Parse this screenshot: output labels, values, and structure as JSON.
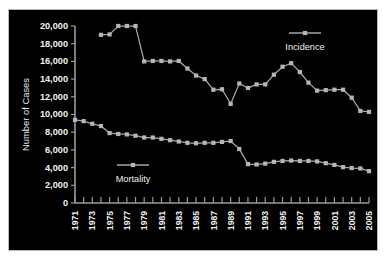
{
  "chart_data": {
    "type": "line",
    "title": "",
    "xlabel": "",
    "ylabel": "Number of Cases",
    "ylim": [
      0,
      20000
    ],
    "ytick_labels": [
      "0",
      "2,000",
      "4,000",
      "6,000",
      "8,000",
      "10,000",
      "12,000",
      "14,000",
      "16,000",
      "18,000",
      "20,000"
    ],
    "ytick_values": [
      0,
      2000,
      4000,
      6000,
      8000,
      10000,
      12000,
      14000,
      16000,
      18000,
      20000
    ],
    "xlim": [
      1971,
      2005
    ],
    "x": [
      1971,
      1972,
      1973,
      1974,
      1975,
      1976,
      1977,
      1978,
      1979,
      1980,
      1981,
      1982,
      1983,
      1984,
      1985,
      1986,
      1987,
      1988,
      1989,
      1990,
      1991,
      1992,
      1993,
      1994,
      1995,
      1996,
      1997,
      1998,
      1999,
      2000,
      2001,
      2002,
      2003,
      2004,
      2005
    ],
    "xtick_labels": [
      "1971",
      "1973",
      "1975",
      "1977",
      "1979",
      "1981",
      "1983",
      "1985",
      "1987",
      "1989",
      "1991",
      "1993",
      "1995",
      "1997",
      "1999",
      "2001",
      "2003",
      "2005"
    ],
    "xtick_values": [
      1971,
      1973,
      1975,
      1977,
      1979,
      1981,
      1983,
      1985,
      1987,
      1989,
      1991,
      1993,
      1995,
      1997,
      1999,
      2001,
      2003,
      2005
    ],
    "grid": false,
    "legend_position": "inside",
    "series": [
      {
        "name": "Incidence",
        "color": "#b6b6b6",
        "x": [
          1974,
          1975,
          1976,
          1977,
          1978,
          1979,
          1980,
          1981,
          1982,
          1983,
          1984,
          1985,
          1986,
          1987,
          1988,
          1989,
          1990,
          1991,
          1992,
          1993,
          1994,
          1995,
          1996,
          1997,
          1998,
          1999,
          2000,
          2001,
          2002,
          2003,
          2004,
          2005
        ],
        "values": [
          19000,
          19050,
          20000,
          20000,
          20000,
          16000,
          16050,
          16050,
          16000,
          16050,
          15200,
          14400,
          14000,
          12800,
          12850,
          11200,
          13500,
          13000,
          13400,
          13400,
          14500,
          15400,
          15800,
          14800,
          13600,
          12700,
          12750,
          12800,
          12800,
          11900,
          10400,
          10300
        ]
      },
      {
        "name": "Mortality",
        "color": "#b6b6b6",
        "x": [
          1971,
          1972,
          1973,
          1974,
          1975,
          1976,
          1977,
          1978,
          1979,
          1980,
          1981,
          1982,
          1983,
          1984,
          1985,
          1986,
          1987,
          1988,
          1989,
          1990,
          1991,
          1992,
          1993,
          1994,
          1995,
          1996,
          1997,
          1998,
          1999,
          2000,
          2001,
          2002,
          2003,
          2004,
          2005
        ],
        "values": [
          9400,
          9250,
          8950,
          8700,
          7900,
          7800,
          7750,
          7600,
          7400,
          7400,
          7250,
          7100,
          6950,
          6800,
          6750,
          6800,
          6800,
          6900,
          7000,
          6100,
          4400,
          4350,
          4450,
          4650,
          4750,
          4800,
          4750,
          4750,
          4700,
          4500,
          4300,
          4050,
          3950,
          3900,
          3600
        ]
      }
    ]
  },
  "legend": {
    "incidence_label": "Incidence",
    "mortality_label": "Mortality"
  },
  "colors": {
    "background": "#000000",
    "frame": "#b9b9b9",
    "axis": "#9a9a9a",
    "series": "#b6b6b6",
    "text": "#f2f2f2"
  }
}
